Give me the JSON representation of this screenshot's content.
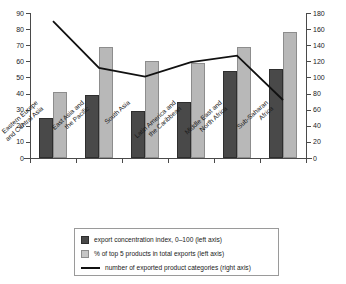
{
  "chart_data": {
    "type": "bar",
    "title": "",
    "xlabel": "",
    "ylabel": "",
    "grid": false,
    "legend_position": "bottom-center",
    "categories": [
      "Eastern Europe and Central Asia",
      "East Asia and the Pacific",
      "South Asia",
      "Latin America and the Caribbean",
      "Middle East and North Africa",
      "Sub-Saharan Africa"
    ],
    "category_lines": [
      [
        "Eastern Europe",
        "and Central Asia"
      ],
      [
        "East Asia and",
        "the Pacific"
      ],
      [
        "South Asia"
      ],
      [
        "Latin America and",
        "the Caribbean"
      ],
      [
        "Middle East and",
        "North Africa"
      ],
      [
        "Sub-Saharan",
        "Africa"
      ]
    ],
    "left_axis": {
      "label": "",
      "ylim": [
        0,
        90
      ],
      "ticks": [
        0,
        10,
        20,
        30,
        40,
        50,
        60,
        70,
        80,
        90
      ]
    },
    "right_axis": {
      "label": "",
      "ylim": [
        0,
        180
      ],
      "ticks": [
        0,
        20,
        40,
        60,
        80,
        100,
        120,
        140,
        160,
        180
      ]
    },
    "series": [
      {
        "name": "export concentration index, 0–100 (left axis)",
        "type": "bar",
        "axis": "left",
        "color": "#494949",
        "values": [
          25,
          39,
          29,
          35,
          54,
          55
        ]
      },
      {
        "name": "% of top 5 products in total exports (left axis)",
        "type": "bar",
        "axis": "left",
        "color": "#b8b8b8",
        "values": [
          41,
          69,
          60,
          59,
          69,
          78
        ]
      },
      {
        "name": "number of exported product categories (right axis)",
        "type": "line",
        "axis": "right",
        "color": "#111111",
        "values": [
          170,
          112,
          101,
          119,
          127,
          72
        ]
      }
    ]
  },
  "legend": {
    "items": [
      {
        "marker": "dark-square-swatch",
        "label": "export concentration index, 0–100 (left axis)"
      },
      {
        "marker": "light-square-swatch",
        "label": "% of top 5 products in total exports (left axis)"
      },
      {
        "marker": "black-line-swatch",
        "label": "number of exported product categories (right axis)"
      }
    ]
  }
}
